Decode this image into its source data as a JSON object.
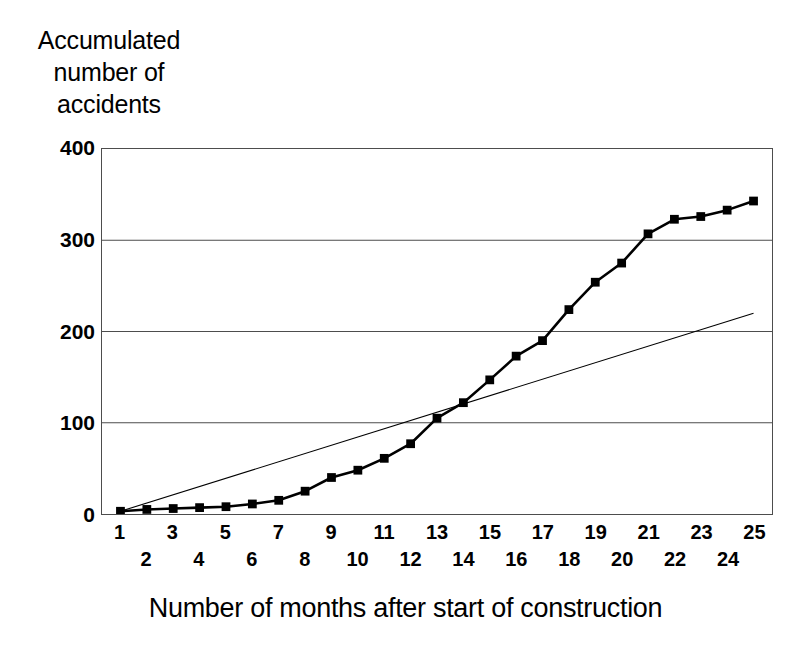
{
  "chart_data": {
    "type": "line",
    "title": "",
    "ylabel": "Accumulated number of accidents",
    "ylabel_lines": [
      "Accumulated",
      "number of",
      "accidents"
    ],
    "xlabel": "Number of months after start of construction",
    "xlim": [
      0.3,
      25.7
    ],
    "ylim": [
      0,
      400
    ],
    "yticks": [
      0,
      100,
      200,
      300,
      400
    ],
    "ytick_labels": [
      "400",
      "300",
      "200",
      "100",
      "0"
    ],
    "xticks": [
      1,
      2,
      3,
      4,
      5,
      6,
      7,
      8,
      9,
      10,
      11,
      12,
      13,
      14,
      15,
      16,
      17,
      18,
      19,
      20,
      21,
      22,
      23,
      24,
      25
    ],
    "xtick_labels": [
      "1",
      "2",
      "3",
      "4",
      "5",
      "6",
      "7",
      "8",
      "9",
      "10",
      "11",
      "12",
      "13",
      "14",
      "15",
      "16",
      "17",
      "18",
      "19",
      "20",
      "21",
      "22",
      "23",
      "24",
      "25"
    ],
    "xtick_label_style": "staggered-odd-top-even-bottom",
    "grid": "horizontal-only",
    "legend": "none",
    "series": [
      {
        "name": "Accumulated number of accidents",
        "marker": "square",
        "color": "#000000",
        "line_width": 2.6,
        "x": [
          1,
          2,
          3,
          4,
          5,
          6,
          7,
          8,
          9,
          10,
          11,
          12,
          13,
          14,
          15,
          16,
          17,
          18,
          19,
          20,
          21,
          22,
          23,
          24,
          25
        ],
        "values": [
          3,
          5,
          6,
          7,
          8,
          11,
          15,
          25,
          40,
          48,
          61,
          77,
          105,
          122,
          147,
          173,
          190,
          224,
          254,
          275,
          307,
          323,
          326,
          333,
          343
        ]
      },
      {
        "name": "Linear reference line",
        "marker": "none",
        "color": "#000000",
        "line_width": 1.1,
        "x": [
          1,
          25
        ],
        "values": [
          3,
          220
        ]
      }
    ]
  }
}
